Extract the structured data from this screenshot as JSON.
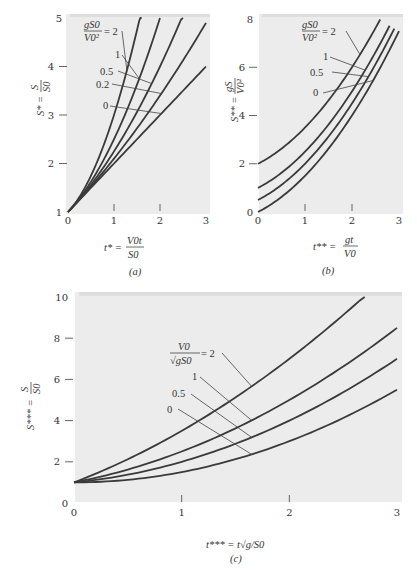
{
  "figure": {
    "background_color": "#ffffff",
    "plot_background": "#ececec",
    "curve_color": "#3a3a3a"
  },
  "chart_data": [
    {
      "id": "a",
      "type": "line",
      "caption": "(a)",
      "xlabel": "t* = V0 t / S0",
      "xlabel_parts": {
        "lhs": "t* =",
        "num": "V0t",
        "den": "S0"
      },
      "ylabel": "S* = S / S0",
      "ylabel_parts": {
        "lhs": "S* =",
        "num": "S",
        "den": "S0"
      },
      "xlim": [
        0,
        3
      ],
      "ylim": [
        1,
        5
      ],
      "xticks": [
        0,
        1,
        2,
        3
      ],
      "yticks": [
        1,
        2,
        3,
        4,
        5
      ],
      "xtick_labels": [
        "0",
        "1",
        "2",
        "3"
      ],
      "ytick_labels": [
        "1",
        "2",
        "3",
        "4",
        "5"
      ],
      "legend_title": "gS0/V0² =",
      "legend_title_parts": {
        "num": "gS0",
        "den": "V0²",
        "eq": "= 2"
      },
      "formula": "S* = 1 + t* + (α/2) t*², α = gS0/V0²",
      "series": [
        {
          "name": "2",
          "label": "= 2",
          "param": 2,
          "x": [
            0,
            0.2,
            0.4,
            0.6,
            0.8,
            1.0,
            1.2,
            1.4,
            1.6
          ],
          "values": [
            1,
            1.24,
            1.56,
            1.96,
            2.44,
            3.0,
            3.64,
            4.36,
            5.16
          ]
        },
        {
          "name": "1",
          "label": "1",
          "param": 1,
          "x": [
            0,
            0.4,
            0.8,
            1.2,
            1.6,
            2.0
          ],
          "values": [
            1,
            1.48,
            2.12,
            2.92,
            3.88,
            5.0
          ]
        },
        {
          "name": "0.5",
          "label": "0.5",
          "param": 0.5,
          "x": [
            0,
            0.5,
            1.0,
            1.5,
            2.0,
            2.5
          ],
          "values": [
            1,
            1.56,
            2.25,
            3.06,
            4.0,
            5.06
          ]
        },
        {
          "name": "0.2",
          "label": "0.2",
          "param": 0.2,
          "x": [
            0,
            0.5,
            1.0,
            1.5,
            2.0,
            2.5,
            3.0
          ],
          "values": [
            1,
            1.53,
            2.1,
            2.73,
            3.4,
            4.13,
            4.9
          ]
        },
        {
          "name": "0",
          "label": "0",
          "param": 0,
          "x": [
            0,
            1,
            2,
            3
          ],
          "values": [
            1,
            2,
            3,
            4
          ]
        }
      ]
    },
    {
      "id": "b",
      "type": "line",
      "caption": "(b)",
      "xlabel": "t** = g t / V0",
      "xlabel_parts": {
        "lhs": "t** =",
        "num": "gt",
        "den": "V0"
      },
      "ylabel": "S** = g S / V0²",
      "ylabel_parts": {
        "lhs": "S** =",
        "num": "gS",
        "den": "V0²"
      },
      "xlim": [
        0,
        3
      ],
      "ylim": [
        0,
        8
      ],
      "xticks": [
        0,
        1,
        2,
        3
      ],
      "yticks": [
        0,
        2,
        4,
        6,
        8
      ],
      "xtick_labels": [
        "0",
        "1",
        "2",
        "3"
      ],
      "ytick_labels": [
        "0",
        "2",
        "4",
        "6",
        "8"
      ],
      "legend_title": "gS0/V0² =",
      "legend_title_parts": {
        "num": "gS0",
        "den": "V0²",
        "eq": "= 2"
      },
      "formula": "S** = α + t** + t**²/2, α = gS0/V0²",
      "series": [
        {
          "name": "2",
          "label": "= 2",
          "param": 2,
          "x": [
            0,
            0.5,
            1.0,
            1.5,
            2.0,
            2.5,
            2.6
          ],
          "values": [
            2,
            2.63,
            3.5,
            4.63,
            6.0,
            7.63,
            7.98
          ]
        },
        {
          "name": "1",
          "label": "1",
          "param": 1,
          "x": [
            0,
            0.5,
            1.0,
            1.5,
            2.0,
            2.5,
            2.8
          ],
          "values": [
            1,
            1.63,
            2.5,
            3.63,
            5.0,
            6.63,
            7.72
          ]
        },
        {
          "name": "0.5",
          "label": "0.5",
          "param": 0.5,
          "x": [
            0,
            0.5,
            1.0,
            1.5,
            2.0,
            2.5,
            2.9
          ],
          "values": [
            0.5,
            1.13,
            2.0,
            3.13,
            4.5,
            6.13,
            7.61
          ]
        },
        {
          "name": "0",
          "label": "0",
          "param": 0,
          "x": [
            0,
            0.5,
            1.0,
            1.5,
            2.0,
            2.5,
            3.0
          ],
          "values": [
            0,
            0.63,
            1.5,
            2.63,
            4.0,
            5.63,
            7.5
          ]
        }
      ]
    },
    {
      "id": "c",
      "type": "line",
      "caption": "(c)",
      "xlabel": "t*** = t √(g/S0)",
      "xlabel_parts": {
        "lhs": "t*** =",
        "rhs": "t√g/S0"
      },
      "ylabel": "S*** = S / S0",
      "ylabel_parts": {
        "lhs": "S*** =",
        "num": "S",
        "den": "S0"
      },
      "xlim": [
        0,
        3
      ],
      "ylim": [
        0,
        10
      ],
      "xticks": [
        0,
        1,
        2,
        3
      ],
      "yticks": [
        0,
        2,
        4,
        6,
        8,
        10
      ],
      "xtick_labels": [
        "0",
        "1",
        "2",
        "3"
      ],
      "ytick_labels": [
        "0",
        "2",
        "4",
        "6",
        "8",
        "10"
      ],
      "legend_title": "V0/√(gS0) =",
      "legend_title_parts": {
        "num": "V0",
        "den": "√gS0",
        "eq": "= 2"
      },
      "formula": "S*** = 1 + β t*** + t***²/2, β = V0/√(gS0)",
      "series": [
        {
          "name": "2",
          "label": "= 2",
          "param": 2,
          "x": [
            0,
            0.5,
            1.0,
            1.5,
            2.0,
            2.5,
            2.7
          ],
          "values": [
            1,
            2.13,
            3.5,
            5.13,
            7.0,
            9.13,
            10.05
          ]
        },
        {
          "name": "1",
          "label": "1",
          "param": 1,
          "x": [
            0,
            0.5,
            1.0,
            1.5,
            2.0,
            2.5,
            3.0
          ],
          "values": [
            1,
            1.63,
            2.5,
            3.63,
            5.0,
            6.63,
            8.5
          ]
        },
        {
          "name": "0.5",
          "label": "0.5",
          "param": 0.5,
          "x": [
            0,
            0.5,
            1.0,
            1.5,
            2.0,
            2.5,
            3.0
          ],
          "values": [
            1,
            1.38,
            2.0,
            2.88,
            4.0,
            5.38,
            7.0
          ]
        },
        {
          "name": "0",
          "label": "0",
          "param": 0,
          "x": [
            0,
            0.5,
            1.0,
            1.5,
            2.0,
            2.5,
            3.0
          ],
          "values": [
            1,
            1.13,
            1.5,
            2.13,
            3.0,
            4.13,
            5.5
          ]
        }
      ]
    }
  ]
}
